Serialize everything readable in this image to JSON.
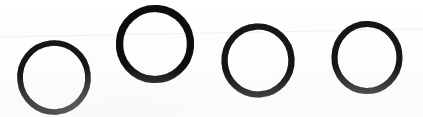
{
  "image": {
    "kind": "scanned-ink-drawing",
    "width": 423,
    "height": 117,
    "background_color": "#fdfdfd",
    "ink_color": "#111111",
    "description": "Four hand-drawn black ink circles in a row on white paper"
  },
  "shapes": {
    "label": "hand-drawn-circles",
    "count": 4,
    "items": [
      {
        "name": "circle-1",
        "cx": 54,
        "cy": 77.5,
        "rx": 34,
        "ry": 34.5,
        "stroke_width": 5.6,
        "rotation": -6,
        "color": "#121212"
      },
      {
        "name": "circle-2",
        "cx": 155,
        "cy": 44,
        "rx": 35.5,
        "ry": 35.5,
        "stroke_width": 7.2,
        "rotation": 4,
        "color": "#101010"
      },
      {
        "name": "circle-3",
        "cx": 258,
        "cy": 60.5,
        "rx": 33.5,
        "ry": 34,
        "stroke_width": 6.2,
        "rotation": -3,
        "color": "#121212"
      },
      {
        "name": "circle-4",
        "cx": 367,
        "cy": 57.5,
        "rx": 32.5,
        "ry": 33.5,
        "stroke_width": 6.0,
        "rotation": 2,
        "color": "#131313"
      }
    ]
  },
  "artifacts": {
    "scan_line": {
      "name": "faint-scan-line",
      "color": "#f1f1f3",
      "x1": 0,
      "y1": 37,
      "x2": 423,
      "y2": 29,
      "stroke_width": 1
    }
  }
}
